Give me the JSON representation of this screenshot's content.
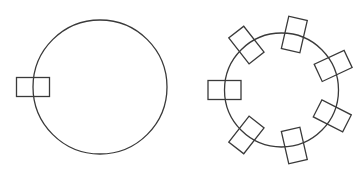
{
  "diagram": {
    "width": 364,
    "height": 177,
    "stroke_color": "#3a3a3a",
    "background": "#ffffff",
    "panels": [
      {
        "name": "single-marker-circle",
        "circle": {
          "cx": 100,
          "cy": 87,
          "r": 67
        },
        "marker_size": {
          "length": 33,
          "width": 19
        },
        "markers_deg": [
          180
        ]
      },
      {
        "name": "seven-marker-circle",
        "circle": {
          "cx": 281.5,
          "cy": 90,
          "r": 57
        },
        "marker_size": {
          "length": 33,
          "width": 19
        },
        "markers_deg": [
          180,
          232,
          283,
          335,
          27,
          77,
          128
        ]
      }
    ]
  }
}
